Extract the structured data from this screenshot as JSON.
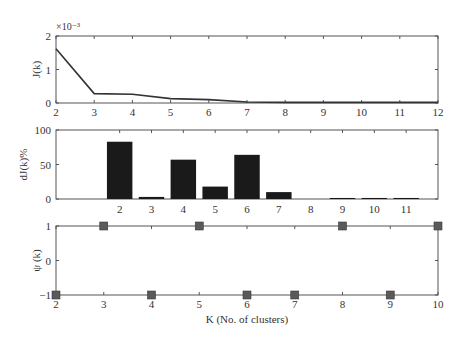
{
  "chart_data": [
    {
      "type": "line",
      "title": "",
      "xlabel": "",
      "ylabel": "J(k)",
      "y_exponent_label": "×10⁻³",
      "x": [
        2,
        3,
        4,
        5,
        6,
        7,
        8,
        9,
        10,
        11,
        12
      ],
      "values": [
        1.62,
        0.28,
        0.26,
        0.13,
        0.1,
        0.03,
        0.02,
        0.02,
        0.02,
        0.02,
        0.02
      ],
      "value_scale": 0.001,
      "xlim": [
        2,
        12
      ],
      "ylim": [
        0,
        2
      ],
      "xticks": [
        "2",
        "3",
        "4",
        "5",
        "6",
        "7",
        "8",
        "9",
        "10",
        "11",
        "12"
      ],
      "yticks": [
        "0",
        "1",
        "2"
      ],
      "grid": false,
      "line_color": "#333333"
    },
    {
      "type": "bar",
      "title": "",
      "xlabel": "",
      "ylabel": "dJ(k)%",
      "categories": [
        "2",
        "3",
        "4",
        "5",
        "6",
        "7",
        "8",
        "9",
        "10",
        "11"
      ],
      "values": [
        83,
        3,
        57,
        18,
        64,
        10,
        0,
        1.5,
        1.5,
        1.5
      ],
      "ylim": [
        0,
        100
      ],
      "yticks": [
        "0",
        "50",
        "100"
      ],
      "grid": false,
      "bar_color": "#1a1a1a"
    },
    {
      "type": "scatter",
      "title": "",
      "xlabel": "K (No. of clusters)",
      "ylabel": "ψ (k)",
      "x": [
        2,
        3,
        4,
        5,
        6,
        7,
        8,
        9,
        10
      ],
      "values": [
        -1,
        1,
        -1,
        1,
        -1,
        -1,
        1,
        -1,
        1
      ],
      "xlim": [
        2,
        10
      ],
      "ylim": [
        -1,
        1
      ],
      "xticks": [
        "2",
        "3",
        "4",
        "5",
        "6",
        "7",
        "8",
        "9",
        "10"
      ],
      "yticks": [
        "−1",
        "0",
        "1"
      ],
      "grid": false,
      "marker": "square",
      "marker_color": "#5a5a5a"
    }
  ]
}
